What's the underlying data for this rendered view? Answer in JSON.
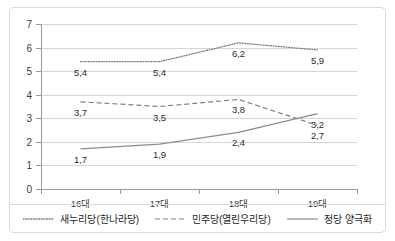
{
  "chart_data": {
    "type": "line",
    "title": "",
    "subtitle": "",
    "xlabel": "",
    "ylabel": "",
    "categories": [
      "16대",
      "17대",
      "18대",
      "19대"
    ],
    "ylim": [
      0,
      7
    ],
    "yticks": [
      "0",
      "1",
      "2",
      "3",
      "4",
      "5",
      "6",
      "7"
    ],
    "grid": true,
    "legend_position": "bottom",
    "decimal_separator": ",",
    "series": [
      {
        "name": "새누리당(한나라당)",
        "style": "dotted",
        "color": "#808080",
        "values": [
          5.4,
          5.4,
          6.2,
          5.9
        ],
        "labels": [
          "5,4",
          "5,4",
          "6,2",
          "5,9"
        ]
      },
      {
        "name": "민주당(열린우리당)",
        "style": "dashed",
        "color": "#808080",
        "values": [
          3.7,
          3.5,
          3.8,
          2.7
        ],
        "labels": [
          "3,7",
          "3,5",
          "3,8",
          "2,7"
        ]
      },
      {
        "name": "정당 양극화",
        "style": "solid",
        "color": "#8c8c8c",
        "values": [
          1.7,
          1.9,
          2.4,
          3.2
        ],
        "labels": [
          "1,7",
          "1,9",
          "2,4",
          "3,2"
        ]
      }
    ]
  },
  "axes": {
    "y_tick_labels": [
      "7",
      "6",
      "5",
      "4",
      "3",
      "2",
      "1",
      "0"
    ],
    "x_tick_labels": [
      "16대",
      "17대",
      "18대",
      "19대"
    ]
  },
  "legend": {
    "items": [
      {
        "label": "새누리당(한나라당)",
        "style": "dotted"
      },
      {
        "label": "민주당(열린우리당)",
        "style": "dashed"
      },
      {
        "label": "정당 양극화",
        "style": "solid"
      }
    ]
  }
}
